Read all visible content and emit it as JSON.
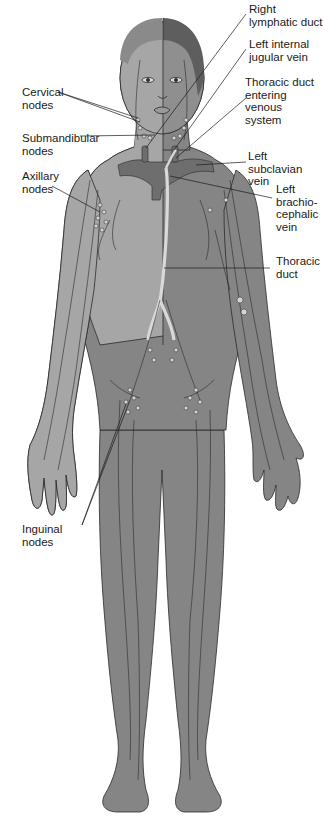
{
  "figure": {
    "colors": {
      "background": "#ffffff",
      "body_light": "#a6a6a6",
      "body_mid": "#8f8f8f",
      "body_dark": "#858585",
      "hair_dark": "#5e5e5e",
      "hair_light": "#8a8a8a",
      "vein": "#6e6e6e",
      "duct": "#d9d9d9",
      "outline": "#2a2a2a",
      "node": "#d4d4d4"
    }
  },
  "labels": {
    "left_side": [
      {
        "id": "cervical",
        "text": "Cervical\nnodes"
      },
      {
        "id": "submandibular",
        "text": "Submandibular\nnodes"
      },
      {
        "id": "axillary",
        "text": "Axillary\nnodes"
      },
      {
        "id": "inguinal",
        "text": "Inguinal\nnodes"
      }
    ],
    "right_side": [
      {
        "id": "right_lymphatic_duct",
        "text": "Right\nlymphatic duct"
      },
      {
        "id": "left_internal_jugular",
        "text": "Left internal\njugular vein"
      },
      {
        "id": "thoracic_duct_entering",
        "text": "Thoracic duct\nentering venous\nsystem"
      },
      {
        "id": "left_subclavian",
        "text": "Left subclavian\nvein"
      },
      {
        "id": "left_brachiocephalic",
        "text": "Left\nbrachio-\ncephalic\nvein"
      },
      {
        "id": "thoracic_duct",
        "text": "Thoracic\nduct"
      }
    ]
  }
}
